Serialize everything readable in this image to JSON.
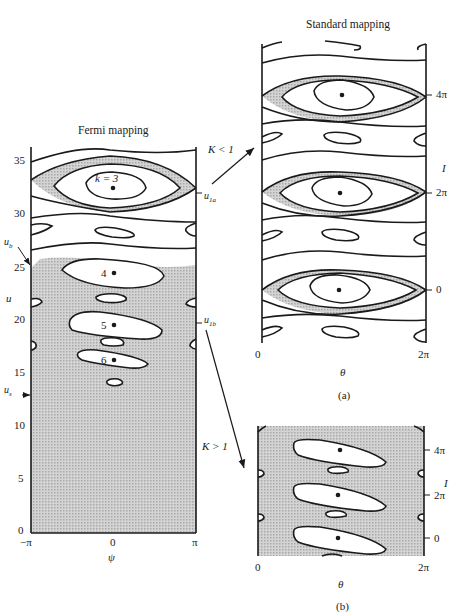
{
  "fermi": {
    "title": "Fermi mapping",
    "y_axis_label": "u",
    "x_axis_label": "ψ",
    "y_ticks": [
      "35",
      "30",
      "25",
      "20",
      "15",
      "10",
      "5",
      "0"
    ],
    "x_ticks": [
      "−π",
      "0",
      "π"
    ],
    "island_labels": [
      "k = 3",
      "4",
      "5",
      "6"
    ],
    "markers": {
      "ub": "u_b",
      "us": "u_s",
      "u1a": "u_1a",
      "u1b": "u_1b"
    }
  },
  "standard_a": {
    "title": "Standard mapping",
    "y_axis_label": "I",
    "x_axis_label": "θ",
    "y_ticks": [
      "4π",
      "2π",
      "0"
    ],
    "x_ticks": [
      "0",
      "2π"
    ],
    "caption": "(a)"
  },
  "standard_b": {
    "y_axis_label": "I",
    "x_axis_label": "θ",
    "y_ticks": [
      "4π",
      "2π",
      "0"
    ],
    "x_ticks": [
      "0",
      "2π"
    ],
    "caption": "(b)"
  },
  "arrows": {
    "upper": "K < 1",
    "lower": "K > 1"
  },
  "colors": {
    "line": "#1a1a1a",
    "shade": "#c8c8c8",
    "bg": "#ffffff"
  }
}
